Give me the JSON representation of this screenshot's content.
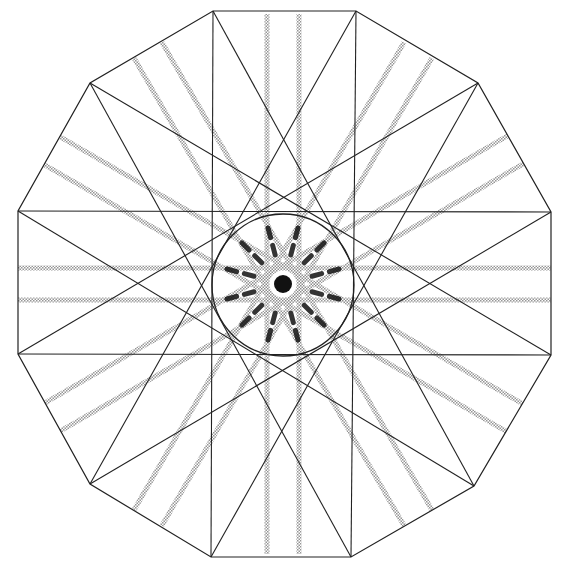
{
  "figure": {
    "kind": "geometric-construction",
    "width": 566,
    "height": 575,
    "center": [
      283,
      284
    ],
    "dodecagon": {
      "vertices": [
        [
          213,
          11
        ],
        [
          356,
          11
        ],
        [
          478,
          83
        ],
        [
          551,
          212
        ],
        [
          551,
          355
        ],
        [
          474,
          486
        ],
        [
          351,
          557
        ],
        [
          211,
          557
        ],
        [
          90,
          484
        ],
        [
          18,
          354
        ],
        [
          18,
          211
        ],
        [
          90,
          83
        ]
      ],
      "stroke": "#222222"
    },
    "star": {
      "type": "{12/5}",
      "step": 5,
      "stroke": "#222222"
    },
    "inner_circle": {
      "cx": 283,
      "cy": 285,
      "r": 71,
      "stroke": "#222222"
    },
    "bands": {
      "count_directions": 12,
      "pair_offsets": [
        -16,
        16
      ],
      "width": 5,
      "color": "#9a9a9a"
    },
    "center_marks": {
      "color": "#111111"
    }
  }
}
